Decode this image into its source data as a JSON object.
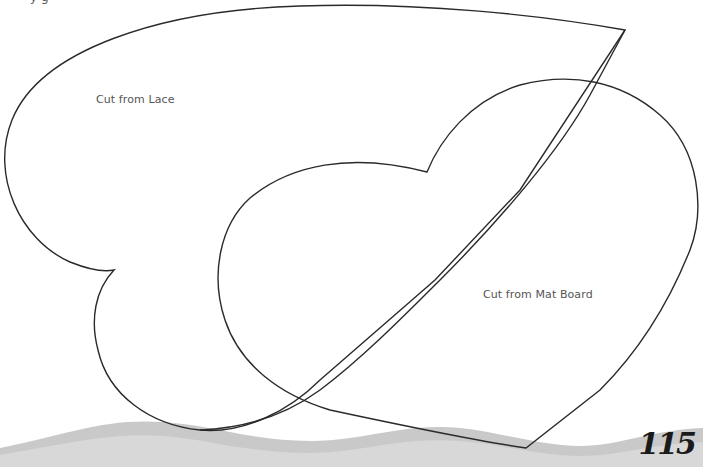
{
  "page": {
    "number": "115",
    "header_fragment": "y g"
  },
  "templates": [
    {
      "name": "lace-heart",
      "label": "Cut from Lace"
    },
    {
      "name": "mat-board-heart",
      "label": "Cut from Mat Board"
    }
  ],
  "colors": {
    "outline": "#2a2a2a",
    "wave": "#c8c8c8",
    "label_text": "#555555",
    "page_number": "#1a1a1a"
  }
}
